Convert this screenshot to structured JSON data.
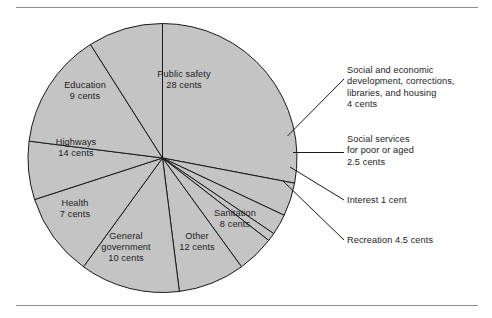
{
  "figure": {
    "background_color": "#ffffff",
    "rule_color": "#8e8e8e",
    "slice_fill": "#c4c4c4",
    "slice_edge": "#1a1a1a",
    "leader_color": "#1a1a1a"
  },
  "chart_data": {
    "type": "pie",
    "title": "",
    "subtitle": "",
    "xlabel": "",
    "ylabel": "",
    "unit": "cents",
    "total": 100,
    "legend_position": "none",
    "grid": false,
    "start_angle_deg": -90,
    "direction": "clockwise",
    "labels": [
      "Public safety",
      "Social and economic development, corrections, libraries, and housing",
      "Social services for poor or aged",
      "Interest",
      "Recreation",
      "Sanitation",
      "Other",
      "General government",
      "Health",
      "Highways",
      "Education"
    ],
    "values": [
      28,
      4,
      2.5,
      1,
      4.5,
      8,
      12,
      10,
      7,
      14,
      9
    ],
    "slices": [
      {
        "name": "public-safety",
        "label": "Public safety",
        "value": 28,
        "value_text": "28 cents",
        "label_mode": "inside"
      },
      {
        "name": "social-economic-development",
        "label": "Social and economic development, corrections, libraries, and housing",
        "value": 4,
        "value_text": "4 cents",
        "label_mode": "callout"
      },
      {
        "name": "social-services",
        "label": "Social services for poor or aged",
        "value": 2.5,
        "value_text": "2.5 cents",
        "label_mode": "callout"
      },
      {
        "name": "interest",
        "label": "Interest",
        "value": 1,
        "value_text": "1 cent",
        "label_mode": "callout"
      },
      {
        "name": "recreation",
        "label": "Recreation",
        "value": 4.5,
        "value_text": "4.5 cents",
        "label_mode": "callout"
      },
      {
        "name": "sanitation",
        "label": "Sanitation",
        "value": 8,
        "value_text": "8 cents",
        "label_mode": "inside"
      },
      {
        "name": "other",
        "label": "Other",
        "value": 12,
        "value_text": "12 cents",
        "label_mode": "inside"
      },
      {
        "name": "general-government",
        "label": "General government",
        "value": 10,
        "value_text": "10 cents",
        "label_mode": "inside"
      },
      {
        "name": "health",
        "label": "Health",
        "value": 7,
        "value_text": "7 cents",
        "label_mode": "inside"
      },
      {
        "name": "highways",
        "label": "Highways",
        "value": 14,
        "value_text": "14 cents",
        "label_mode": "inside"
      },
      {
        "name": "education",
        "label": "Education",
        "value": 9,
        "value_text": "9 cents",
        "label_mode": "inside"
      }
    ]
  },
  "inside_labels": {
    "public_safety": "Public safety\n28 cents",
    "education": "Education\n9 cents",
    "highways": "Highways\n14 cents",
    "health": "Health\n7 cents",
    "general_government": "General\ngovernment\n10 cents",
    "other": "Other\n12 cents",
    "sanitation": "Sanitation\n8 cents"
  },
  "callout_labels": {
    "social_economic": "Social and economic\ndevelopment, corrections,\nlibraries, and housing\n4 cents",
    "social_services": "Social services\nfor poor or aged\n2.5 cents",
    "interest": "Interest 1 cent",
    "recreation": "Recreation 4.5 cents"
  }
}
